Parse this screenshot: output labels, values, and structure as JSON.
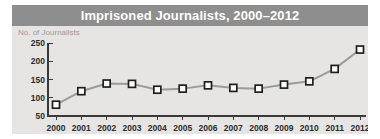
{
  "chart": {
    "title": "Imprisoned Journalists, 2000–2012",
    "ylabel": "No. of Journalists"
  },
  "colors": {
    "title_bar": "#8e8e8e",
    "title_text": "#ffffff",
    "plate": "#e6e5e3",
    "line": "#9b9b99",
    "marker_fill": "#ffffff",
    "marker_stroke": "#1f1f1f",
    "axis": "#3a3a3a",
    "ylabel_text": "#9a9a98",
    "tick_text": "#2b2b2b",
    "page_background": "#ffffff"
  },
  "chart_data": {
    "type": "line",
    "title": "Imprisoned Journalists, 2000–2012",
    "xlabel": "",
    "ylabel": "No. of Journalists",
    "categories": [
      "2000",
      "2001",
      "2002",
      "2003",
      "2004",
      "2005",
      "2006",
      "2007",
      "2008",
      "2009",
      "2010",
      "2011",
      "2012"
    ],
    "values": [
      81,
      118,
      139,
      138,
      122,
      125,
      134,
      127,
      125,
      136,
      145,
      179,
      232
    ],
    "ylim": [
      50,
      250
    ],
    "yticks": [
      50,
      100,
      150,
      200,
      250
    ],
    "ytick_labels": [
      "50",
      "100",
      "150",
      "200",
      "250"
    ],
    "xticks": [
      "2000",
      "2001",
      "2002",
      "2003",
      "2004",
      "2005",
      "2006",
      "2007",
      "2008",
      "2009",
      "2010",
      "2011",
      "2012"
    ],
    "grid": false,
    "legend": null,
    "marker": "square"
  }
}
